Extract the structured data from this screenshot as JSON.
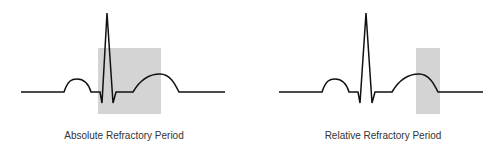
{
  "panels": [
    {
      "label": "Absolute Refractory Period",
      "label_x": 124,
      "shade": {
        "x": 98,
        "y": 48,
        "w": 63,
        "h": 66
      },
      "trace": "M21,92 L64,92 C68,80 72,79 77,79 C83,79 88,82 91,92 L100,92 L102,103 L107,13 L113,103 L116,92 L133,92 C140,80 150,74 160,74 C170,74 175,84 179,92 L225,92"
    },
    {
      "label": "Relative Refractory Period",
      "label_x": 383,
      "shade": {
        "x": 416,
        "y": 48,
        "w": 24,
        "h": 66
      },
      "trace": "M279,92 L322,92 C326,80 330,79 335,79 C341,79 346,82 349,92 L358,92 L360,103 L366,13 L372,103 L375,92 L392,92 C399,80 409,74 419,74 C429,74 434,84 438,92 L483,92"
    }
  ],
  "colors": {
    "shade": "#d4d4d4",
    "trace": "#111111",
    "text": "#333333"
  }
}
